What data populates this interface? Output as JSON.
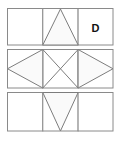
{
  "figure": {
    "background_color": "#ffffff",
    "stroke_color": "#7d7d7d",
    "border_color": "#8a8a8a",
    "fill_color": "#fafafa",
    "label_color": "#111111",
    "geometry": {
      "left": 7,
      "right": 113,
      "cell_width": 35.3,
      "divider_x": [
        42.3,
        77.7
      ],
      "rows": [
        {
          "top": 8,
          "bottom": 45
        },
        {
          "top": 49,
          "bottom": 88
        },
        {
          "top": 92,
          "bottom": 131
        }
      ]
    },
    "rows": [
      {
        "name": "top-strip",
        "cells": [
          {
            "name": "cell-top-left",
            "content": "empty"
          },
          {
            "name": "cell-top-center",
            "content": "triangle-up"
          },
          {
            "name": "cell-top-right",
            "content": "label",
            "label": "D"
          }
        ]
      },
      {
        "name": "middle-strip",
        "cells": [
          {
            "name": "cell-middle-left",
            "content": "triangle-left"
          },
          {
            "name": "cell-middle-center",
            "content": "diagonal-cross"
          },
          {
            "name": "cell-middle-right",
            "content": "triangle-right"
          }
        ]
      },
      {
        "name": "bottom-strip",
        "cells": [
          {
            "name": "cell-bottom-left",
            "content": "empty"
          },
          {
            "name": "cell-bottom-center",
            "content": "triangle-down"
          },
          {
            "name": "cell-bottom-right",
            "content": "empty"
          }
        ]
      }
    ],
    "answer_marker": "D"
  }
}
